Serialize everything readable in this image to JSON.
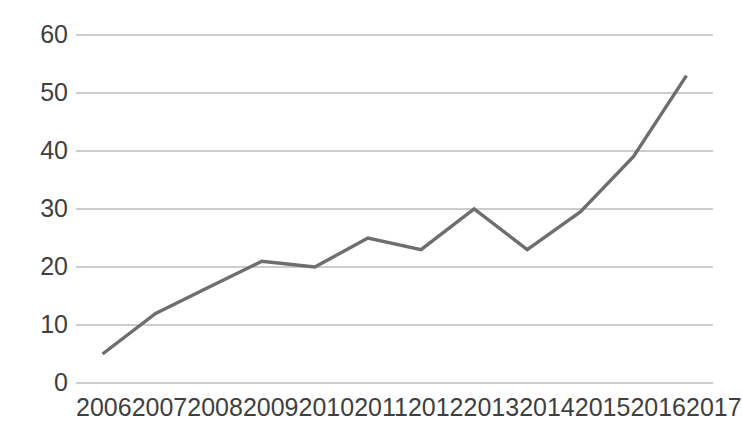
{
  "chart_data": {
    "type": "line",
    "title": "",
    "subtitle": "",
    "xlabel": "",
    "ylabel": "",
    "categories": [
      "2006",
      "2007",
      "2008",
      "2009",
      "2010",
      "2011",
      "2012",
      "2013",
      "2014",
      "2015",
      "2016",
      "2017"
    ],
    "values": [
      5,
      12,
      16.5,
      21,
      20,
      25,
      23,
      30,
      23,
      29.5,
      39,
      53
    ],
    "series": [
      {
        "name": "",
        "values": [
          5,
          12,
          16.5,
          21,
          20,
          25,
          23,
          30,
          23,
          29.5,
          39,
          53
        ]
      }
    ],
    "ylim": [
      0,
      60
    ],
    "y_ticks": [
      0,
      10,
      20,
      30,
      40,
      50,
      60
    ],
    "y_tick_labels": [
      "0",
      "10",
      "20",
      "30",
      "40",
      "50",
      "60"
    ],
    "grid": true,
    "grid_axis": "y",
    "legend": false,
    "legend_position": "none",
    "annotations": [],
    "colors": {
      "line": "#6e6e6e",
      "grid": "#9a9a9a",
      "background": "#ffffff",
      "tick_label": "#3f3f3f"
    },
    "line_width": 3.4,
    "markers": false
  },
  "axis": {
    "y_labels": [
      "60",
      "50",
      "40",
      "30",
      "20",
      "10",
      "0"
    ],
    "x_labels": [
      "2006",
      "2007",
      "2008",
      "2009",
      "2010",
      "2011",
      "2012",
      "2013",
      "2014",
      "2015",
      "2016",
      "2017"
    ]
  }
}
